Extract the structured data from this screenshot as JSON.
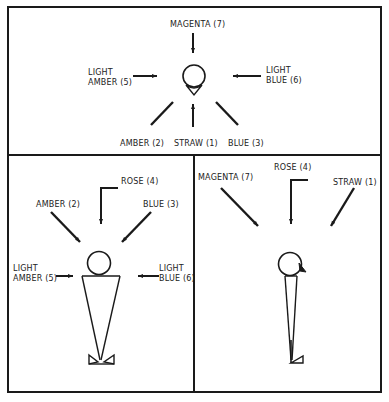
{
  "diagram": {
    "colors": {
      "line": "#1a1a1a",
      "background": "#ffffff",
      "text": "#222222"
    },
    "panels": [
      {
        "name": "top-view",
        "labels": {
          "magenta": "MAGENTA (7)",
          "light_amber_1": "LIGHT",
          "light_amber_2": "AMBER (5)",
          "light_blue_1": "LIGHT",
          "light_blue_2": "BLUE (6)",
          "amber": "AMBER (2)",
          "straw": "STRAW (1)",
          "blue": "BLUE (3)"
        }
      },
      {
        "name": "front-view",
        "labels": {
          "rose": "ROSE (4)",
          "amber": "AMBER (2)",
          "blue": "BLUE (3)",
          "light_amber_1": "LIGHT",
          "light_amber_2": "AMBER (5)",
          "light_blue_1": "LIGHT",
          "light_blue_2": "BLUE (6)"
        }
      },
      {
        "name": "side-view",
        "labels": {
          "magenta": "MAGENTA (7)",
          "rose": "ROSE (4)",
          "straw": "STRAW (1)"
        }
      }
    ]
  }
}
